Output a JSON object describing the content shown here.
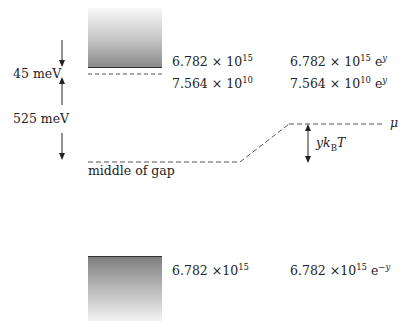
{
  "diagram": {
    "conduction_band": {
      "label": "conduction band",
      "density": "6.782 × 10^15",
      "density_mantissa": "6.782 × 10",
      "density_exp": "15",
      "density_scaled_mantissa": "6.782 × 10",
      "density_scaled_exp": "15",
      "density_scaled_factor": "e",
      "density_scaled_factor_exp": "y"
    },
    "donor_level": {
      "density_mantissa": "7.564 × 10",
      "density_exp": "10",
      "density_scaled_mantissa": "7.564 × 10",
      "density_scaled_exp": "10",
      "density_scaled_factor": "e",
      "density_scaled_factor_exp": "y"
    },
    "valence_band": {
      "density_mantissa": "6.782 ×10",
      "density_exp": "15",
      "density_scaled_mantissa": "6.782 ×10",
      "density_scaled_exp": "15",
      "density_scaled_factor": "e",
      "density_scaled_factor_exp": "−y"
    },
    "energies": {
      "donor_gap": "45 meV",
      "donor_to_midgap": "525 meV"
    },
    "midgap_label": "middle of gap",
    "chemical_potential_label": "μ",
    "shift_label_y": "yk",
    "shift_label_sub": "B",
    "shift_label_T": "T",
    "colors": {
      "line": "#333333",
      "dashed": "#555555",
      "band_dark": "#7e7e7e",
      "band_light": "#f5f5f5"
    }
  }
}
